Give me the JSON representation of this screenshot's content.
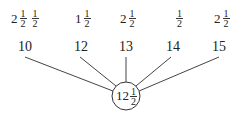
{
  "top_row": [
    {
      "whole": "2",
      "num": "1",
      "den": "2",
      "extra_num": "1",
      "extra_den": "2"
    },
    {
      "whole": "1",
      "num": "1",
      "den": "2"
    },
    {
      "whole": "2",
      "num": "1",
      "den": "2"
    },
    {
      "whole": "",
      "num": "1",
      "den": "2"
    },
    {
      "whole": "2",
      "num": "1",
      "den": "2"
    }
  ],
  "middle_row": [
    "10",
    "12",
    "13",
    "14",
    "15"
  ],
  "center": {
    "whole": "12",
    "num": "1",
    "den": "2"
  }
}
